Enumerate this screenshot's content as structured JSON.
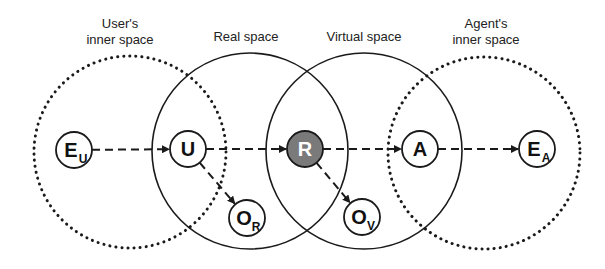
{
  "regions": [
    {
      "id": "user-inner",
      "title_lines": [
        "User's",
        "inner space"
      ],
      "style": "dotted"
    },
    {
      "id": "real",
      "title_lines": [
        "Real space"
      ],
      "style": "solid"
    },
    {
      "id": "virtual",
      "title_lines": [
        "Virtual space"
      ],
      "style": "solid"
    },
    {
      "id": "agent-inner",
      "title_lines": [
        "Agent's",
        "inner space"
      ],
      "style": "dotted"
    }
  ],
  "nodes": [
    {
      "id": "EU",
      "main": "E",
      "sub": "U",
      "filled": false
    },
    {
      "id": "U",
      "main": "U",
      "sub": "",
      "filled": false
    },
    {
      "id": "R",
      "main": "R",
      "sub": "",
      "filled": true
    },
    {
      "id": "A",
      "main": "A",
      "sub": "",
      "filled": false
    },
    {
      "id": "EA",
      "main": "E",
      "sub": "A",
      "filled": false
    },
    {
      "id": "OR",
      "main": "O",
      "sub": "R",
      "filled": false
    },
    {
      "id": "OV",
      "main": "O",
      "sub": "V",
      "filled": false
    }
  ],
  "edges": [
    {
      "from": "EU",
      "to": "U"
    },
    {
      "from": "U",
      "to": "R"
    },
    {
      "from": "R",
      "to": "A"
    },
    {
      "from": "A",
      "to": "EA"
    },
    {
      "from": "U",
      "to": "OR"
    },
    {
      "from": "R",
      "to": "OV"
    }
  ],
  "colors": {
    "stroke": "#1a1a1a",
    "filled_node": "#7a7a7a",
    "filled_node_text": "#ffffff",
    "background": "#ffffff"
  }
}
